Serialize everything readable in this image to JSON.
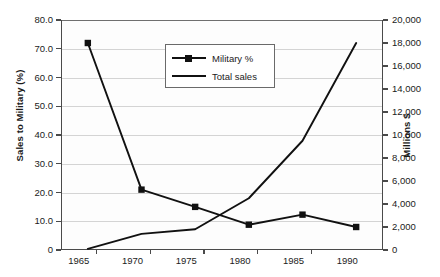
{
  "chart_data": {
    "type": "line",
    "title": "",
    "xlabel": "",
    "ylabel": "Sales to Military (%)",
    "y2label": "Millions $",
    "categories": [
      "1965",
      "1970",
      "1975",
      "1980",
      "1985",
      "1990"
    ],
    "x": [
      1965,
      1970,
      1975,
      1980,
      1985,
      1990
    ],
    "ylim": [
      0,
      80
    ],
    "y2lim": [
      0,
      20000
    ],
    "yticks": [
      "0",
      "10.0",
      "20.0",
      "30.0",
      "40.0",
      "50.0",
      "60.0",
      "70.0",
      "80.0"
    ],
    "ytick_values": [
      0,
      10,
      20,
      30,
      40,
      50,
      60,
      70,
      80
    ],
    "y2ticks": [
      "0",
      "2,000",
      "4,000",
      "6,000",
      "8,000",
      "10,000",
      "12,000",
      "14,000",
      "16,000",
      "18,000",
      "20,000"
    ],
    "y2tick_values": [
      0,
      2000,
      4000,
      6000,
      8000,
      10000,
      12000,
      14000,
      16000,
      18000,
      20000
    ],
    "grid": true,
    "legend_position": "upper-center",
    "series": [
      {
        "name": "Military %",
        "axis": "left",
        "marker": "square",
        "values": [
          72,
          21,
          15,
          8.8,
          12.3,
          8
        ]
      },
      {
        "name": "Total sales",
        "axis": "right",
        "marker": "none",
        "values": [
          100,
          1400,
          1800,
          4500,
          9500,
          18000
        ]
      }
    ]
  },
  "legend": {
    "items": [
      {
        "label": "Military %",
        "key": "line-with-square-marker"
      },
      {
        "label": "Total sales",
        "key": "plain-line"
      }
    ]
  },
  "colors": {
    "series_line": "#111111",
    "gridline": "#d4d4d4",
    "axis": "#4a4a4a",
    "text": "#1b1b1b",
    "plot_background": "#fdfdfd"
  }
}
